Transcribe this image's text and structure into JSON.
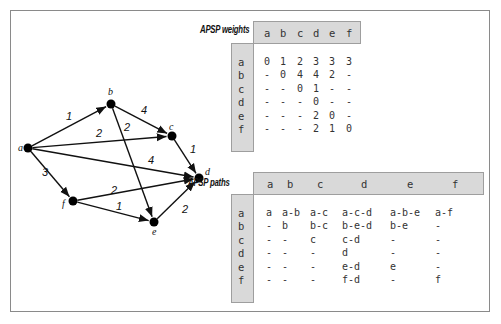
{
  "graph": {
    "nodes": [
      {
        "id": "a",
        "label": "a",
        "x": 28,
        "y": 148
      },
      {
        "id": "b",
        "label": "b",
        "x": 111,
        "y": 104
      },
      {
        "id": "c",
        "label": "c",
        "x": 172,
        "y": 136
      },
      {
        "id": "d",
        "label": "d",
        "x": 199,
        "y": 178
      },
      {
        "id": "e",
        "label": "e",
        "x": 154,
        "y": 222
      },
      {
        "id": "f",
        "label": "f",
        "x": 73,
        "y": 201
      }
    ],
    "edges": [
      {
        "from": "a",
        "to": "b",
        "weight": "1"
      },
      {
        "from": "a",
        "to": "c",
        "weight": "2"
      },
      {
        "from": "a",
        "to": "d",
        "weight": "4"
      },
      {
        "from": "a",
        "to": "f",
        "weight": "3"
      },
      {
        "from": "b",
        "to": "c",
        "weight": "4"
      },
      {
        "from": "b",
        "to": "e",
        "weight": "2"
      },
      {
        "from": "c",
        "to": "d",
        "weight": "1"
      },
      {
        "from": "e",
        "to": "d",
        "weight": "2"
      },
      {
        "from": "f",
        "to": "d",
        "weight": "2"
      },
      {
        "from": "f",
        "to": "e",
        "weight": "1"
      }
    ]
  },
  "weights_table": {
    "caption": "APSP weights",
    "columns": [
      "a",
      "b",
      "c",
      "d",
      "e",
      "f"
    ],
    "rows": [
      "a",
      "b",
      "c",
      "d",
      "e",
      "f"
    ],
    "cells": [
      [
        "0",
        "1",
        "2",
        "3",
        "3",
        "3"
      ],
      [
        "-",
        "0",
        "4",
        "4",
        "2",
        "-"
      ],
      [
        "-",
        "-",
        "0",
        "1",
        "-",
        "-"
      ],
      [
        "-",
        "-",
        "-",
        "0",
        "-",
        "-"
      ],
      [
        "-",
        "-",
        "-",
        "2",
        "0",
        "-"
      ],
      [
        "-",
        "-",
        "-",
        "2",
        "1",
        "0"
      ]
    ]
  },
  "paths_table": {
    "caption": "APSP paths",
    "columns": [
      "a",
      "b",
      "c",
      "d",
      "e",
      "f"
    ],
    "rows": [
      "a",
      "b",
      "c",
      "d",
      "e",
      "f"
    ],
    "cells": [
      [
        "a",
        "a-b",
        "a-c",
        "a-c-d",
        "a-b-e",
        "a-f"
      ],
      [
        "-",
        "b",
        "b-c",
        "b-e-d",
        "b-e",
        "-"
      ],
      [
        "-",
        "-",
        "c",
        "c-d",
        "-",
        "-"
      ],
      [
        "-",
        "-",
        "-",
        "d",
        "-",
        "-"
      ],
      [
        "-",
        "-",
        "-",
        "e-d",
        "e",
        "-"
      ],
      [
        "-",
        "-",
        "-",
        "f-d",
        "-",
        "f"
      ]
    ]
  }
}
